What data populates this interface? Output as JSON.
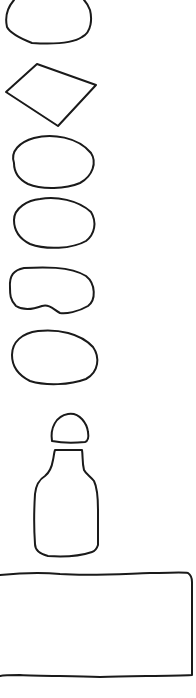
{
  "figure": {
    "type": "hand-drawn outline shapes",
    "shapes": [
      {
        "id": "half-dome",
        "label": "truncated oval (top, cropped)"
      },
      {
        "id": "rhombus",
        "label": "quadrilateral / diamond"
      },
      {
        "id": "oval-1",
        "label": "oval"
      },
      {
        "id": "oval-2",
        "label": "oval"
      },
      {
        "id": "kidney",
        "label": "oval with dent (bean)"
      },
      {
        "id": "oval-3",
        "label": "oval"
      },
      {
        "id": "bottle-cap",
        "label": "rounded cap"
      },
      {
        "id": "bottle",
        "label": "bottle body"
      },
      {
        "id": "rectangle",
        "label": "large rectangle (left edge cropped)"
      }
    ],
    "stroke_color": "#1a1a1a",
    "background": "#ffffff"
  },
  "caption": {
    "text": ""
  }
}
